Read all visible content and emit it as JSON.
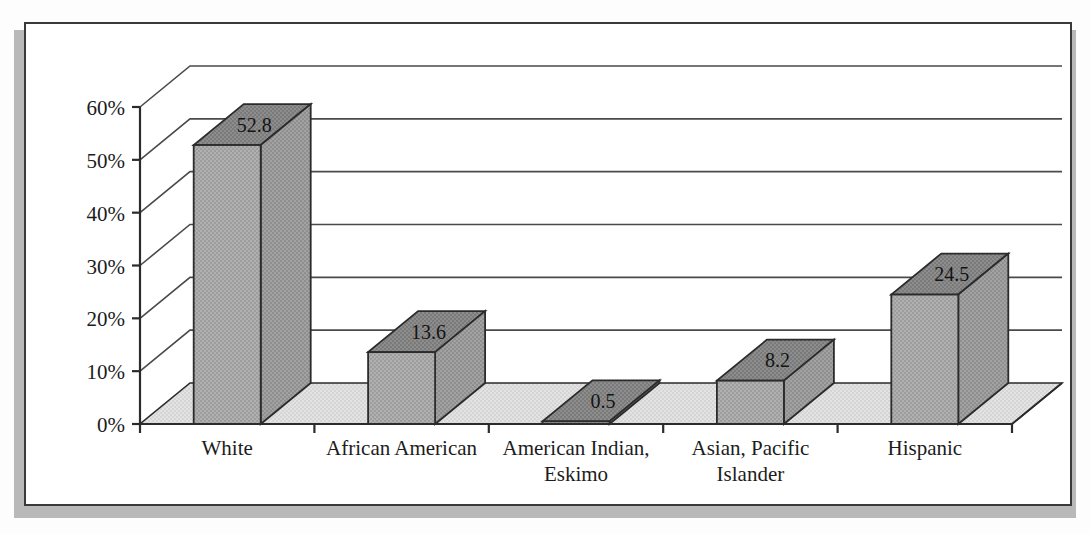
{
  "figure": {
    "background_color": "#ffffff",
    "frame_border_color": "#3a3a3a",
    "shadow_color": "#b9b9b9"
  },
  "chart_data": {
    "type": "bar",
    "title": "",
    "subtitle": "",
    "xlabel": "",
    "ylabel": "",
    "categories": [
      "White",
      "African American",
      "American Indian, Eskimo",
      "Asian, Pacific Islander",
      "Hispanic"
    ],
    "category_lines": [
      [
        "White"
      ],
      [
        "African American"
      ],
      [
        "American Indian,",
        "Eskimo"
      ],
      [
        "Asian, Pacific",
        "Islander"
      ],
      [
        "Hispanic"
      ]
    ],
    "values": [
      52.8,
      13.6,
      0.5,
      8.2,
      24.5
    ],
    "value_labels": [
      "52.8",
      "13.6",
      "0.5",
      "8.2",
      "24.5"
    ],
    "ylim": [
      0,
      60
    ],
    "ytick_values": [
      0,
      10,
      20,
      30,
      40,
      50,
      60
    ],
    "ytick_labels": [
      "0%",
      "10%",
      "20%",
      "30%",
      "40%",
      "50%",
      "60%"
    ],
    "grid": true,
    "grid_axis": "y",
    "legend": false,
    "legend_position": "none",
    "three_d": true,
    "series": [
      {
        "name": "Percent",
        "values": [
          52.8,
          13.6,
          0.5,
          8.2,
          24.5
        ]
      }
    ],
    "colors": {
      "bar_front": "#a9a9a9",
      "bar_side": "#9a9a9a",
      "bar_top": "#868686",
      "floor": "#dedede",
      "outline": "#2b2b2b",
      "gridline": "#4a4a4a"
    }
  }
}
